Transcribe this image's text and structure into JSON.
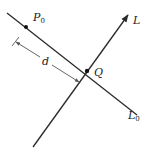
{
  "diagram": {
    "colors": {
      "line": "#2a2a2a",
      "dimension": "#555555",
      "background": "#ffffff"
    },
    "lines": {
      "L0": {
        "label": "L",
        "subscript": "0",
        "from": [
          7,
          13
        ],
        "to": [
          137,
          115
        ]
      },
      "L": {
        "label": "L",
        "subscript": "",
        "from": [
          33,
          147
        ],
        "to": [
          128,
          15
        ],
        "arrow": true
      }
    },
    "points": {
      "P0": {
        "label": "P",
        "subscript": "0",
        "pos": [
          26,
          27
        ]
      },
      "Q": {
        "label": "Q",
        "subscript": "",
        "pos": [
          87,
          71
        ]
      }
    },
    "dimension": {
      "label": "d",
      "from": [
        16,
        42
      ],
      "to": [
        79,
        82
      ]
    }
  }
}
